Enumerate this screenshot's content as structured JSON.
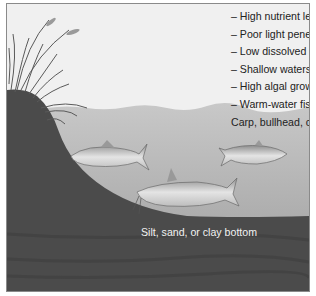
{
  "diagram": {
    "characteristics": [
      "– High nutrient levels",
      "– Poor light penetration",
      "– Low dissolved oxygen",
      "– Shallow waters",
      "– High algal growth",
      "– Warm-water fish:",
      "Carp, bullhead, catfish"
    ],
    "bottom_label": "Silt, sand, or clay bottom",
    "illustrated_elements": [
      "shore-grasses",
      "carp",
      "bullhead",
      "catfish",
      "water",
      "lake-bottom"
    ],
    "colors": {
      "sky": "#f0f0f0",
      "water_top": "#c6c6c6",
      "water_bottom": "#9a9a9a",
      "bottom": "#4a4a4a",
      "frame": "#8a8a8a"
    }
  }
}
